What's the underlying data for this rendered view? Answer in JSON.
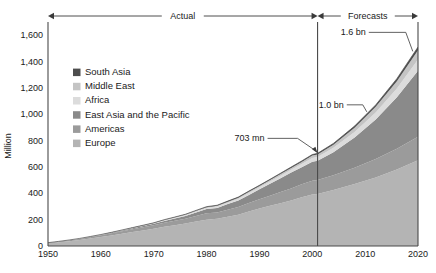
{
  "chart_data": {
    "type": "area",
    "stacked": true,
    "title": "",
    "xlabel": "",
    "ylabel": "Million",
    "xlim": [
      1950,
      2020
    ],
    "ylim": [
      0,
      1700
    ],
    "yticks": [
      0,
      200,
      400,
      600,
      800,
      1000,
      1200,
      1400,
      1600
    ],
    "ytick_labels": [
      "0",
      "200",
      "400",
      "600",
      "800",
      "1,000",
      "1,200",
      "1,400",
      "1,600"
    ],
    "xticks": [
      1950,
      1960,
      1970,
      1980,
      1990,
      2000,
      2010,
      2020
    ],
    "xtick_labels": [
      "1950",
      "1960",
      "1970",
      "1980",
      "1990",
      "2000",
      "2010",
      "2020"
    ],
    "grid": false,
    "legend_position": "inside-upper-left",
    "x": [
      1950,
      1952,
      1954,
      1956,
      1958,
      1960,
      1962,
      1964,
      1966,
      1968,
      1970,
      1972,
      1974,
      1976,
      1978,
      1980,
      1982,
      1984,
      1986,
      1988,
      1990,
      1992,
      1994,
      1996,
      1998,
      2000,
      2001,
      2004,
      2008,
      2012,
      2016,
      2020
    ],
    "series": [
      {
        "name": "Europe",
        "color": "#b4b4b4",
        "values": [
          20,
          28,
          36,
          45,
          56,
          68,
          80,
          93,
          106,
          118,
          130,
          146,
          158,
          170,
          186,
          200,
          206,
          222,
          238,
          262,
          285,
          305,
          325,
          345,
          370,
          390,
          395,
          425,
          470,
          520,
          580,
          650
        ]
      },
      {
        "name": "Americas",
        "color": "#9b9b9b",
        "values": [
          4,
          5,
          7,
          9,
          11,
          13,
          16,
          19,
          22,
          25,
          28,
          31,
          34,
          37,
          42,
          48,
          48,
          54,
          58,
          64,
          70,
          77,
          85,
          92,
          98,
          105,
          106,
          112,
          124,
          140,
          158,
          180
        ]
      },
      {
        "name": "East Asia and the Pacific",
        "color": "#8a8a8a",
        "values": [
          0.5,
          0.8,
          1.2,
          1.8,
          2.5,
          3,
          4,
          5,
          6,
          8,
          10,
          13,
          16,
          20,
          26,
          32,
          35,
          42,
          50,
          62,
          75,
          90,
          105,
          120,
          130,
          145,
          146,
          175,
          230,
          300,
          390,
          500
        ]
      },
      {
        "name": "Africa",
        "color": "#dcdcdc",
        "values": [
          0.5,
          0.7,
          0.9,
          1.1,
          1.4,
          1.7,
          2,
          2.5,
          3,
          3.5,
          4,
          5,
          6,
          7,
          8,
          9,
          10,
          11,
          12,
          14,
          15,
          17,
          19,
          21,
          24,
          27,
          28,
          33,
          42,
          54,
          68,
          85
        ]
      },
      {
        "name": "Middle East",
        "color": "#c4c4c4",
        "values": [
          0.2,
          0.3,
          0.4,
          0.5,
          0.7,
          0.9,
          1.1,
          1.4,
          1.7,
          2,
          2.4,
          3,
          3.6,
          4.3,
          5,
          6,
          6.5,
          7.5,
          8.5,
          9.5,
          10,
          11,
          12,
          14,
          16,
          19,
          20,
          24,
          32,
          42,
          55,
          70
        ]
      },
      {
        "name": "South Asia",
        "color": "#4d4d4d",
        "values": [
          0.1,
          0.15,
          0.2,
          0.3,
          0.4,
          0.5,
          0.6,
          0.8,
          1,
          1.2,
          1.5,
          1.8,
          2.2,
          2.6,
          3,
          3.5,
          3.8,
          4.2,
          4.6,
          5,
          5.5,
          6,
          6.5,
          7,
          7.5,
          8,
          8,
          9.5,
          12,
          15,
          19,
          25
        ]
      }
    ],
    "totals_annotated": [
      {
        "label": "703 mn",
        "year": 2000,
        "value": 703
      },
      {
        "label": "1.0 bn",
        "year": 2010,
        "value": 1000
      },
      {
        "label": "1.6 bn",
        "year": 2020,
        "value": 1600
      }
    ],
    "period_markers": [
      {
        "label": "Actual",
        "from": 1950,
        "to": 2001
      },
      {
        "label": "Forecasts",
        "from": 2001,
        "to": 2020
      }
    ],
    "divider_year": 2001
  },
  "legend": {
    "items": [
      {
        "label": "South Asia",
        "color": "#4d4d4d"
      },
      {
        "label": "Middle East",
        "color": "#c4c4c4"
      },
      {
        "label": "Africa",
        "color": "#dcdcdc"
      },
      {
        "label": "East Asia and the Pacific",
        "color": "#8a8a8a"
      },
      {
        "label": "Americas",
        "color": "#9b9b9b"
      },
      {
        "label": "Europe",
        "color": "#b4b4b4"
      }
    ]
  },
  "axes": {
    "y_title": "Million",
    "y_labels": [
      "1,600",
      "1,400",
      "1,200",
      "1,000",
      "800",
      "600",
      "400",
      "200",
      "0"
    ],
    "x_labels": [
      "1950",
      "1960",
      "1970",
      "1980",
      "1990",
      "2000",
      "2010",
      "2020"
    ]
  },
  "annotations": {
    "actual": "Actual",
    "forecasts": "Forecasts",
    "a703": "703 mn",
    "a10bn": "1.0 bn",
    "a16bn": "1.6 bn"
  }
}
